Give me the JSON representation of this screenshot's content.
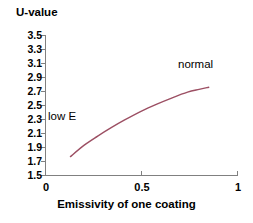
{
  "chart_data": {
    "type": "line",
    "title": "",
    "ylabel": "U-value",
    "xlabel": "Emissivity of one coating",
    "xlim": [
      0,
      1
    ],
    "ylim": [
      1.5,
      3.5
    ],
    "grid": false,
    "legend": "none",
    "xticks": [
      "0",
      "0.5",
      "1"
    ],
    "xtick_values": [
      0,
      0.5,
      1
    ],
    "yticks": [
      "3.5",
      "3.3",
      "3.1",
      "2.9",
      "2.7",
      "2.5",
      "2.3",
      "2.1",
      "1.9",
      "1.7",
      "1.5"
    ],
    "ytick_values": [
      3.5,
      3.3,
      3.1,
      2.9,
      2.7,
      2.5,
      2.3,
      2.1,
      1.9,
      1.7,
      1.5
    ],
    "series": [
      {
        "name": "U-value",
        "color": "#9c4f63",
        "x": [
          0.13,
          0.2,
          0.27,
          0.34,
          0.41,
          0.5,
          0.58,
          0.66,
          0.74,
          0.8,
          0.85
        ],
        "values": [
          1.77,
          1.93,
          2.06,
          2.18,
          2.29,
          2.42,
          2.52,
          2.61,
          2.69,
          2.73,
          2.76
        ]
      }
    ],
    "annotations": [
      {
        "text": "low E",
        "x": 0.14,
        "y": 2.33
      },
      {
        "text": "normal",
        "x": 0.72,
        "y": 3.05
      }
    ]
  },
  "axes": {
    "y_title": "U-value",
    "x_title": "Emissivity of one coating"
  },
  "colors": {
    "curve": "#9c4f63",
    "axis": "#808080",
    "text": "#000000",
    "background": "#ffffff"
  }
}
